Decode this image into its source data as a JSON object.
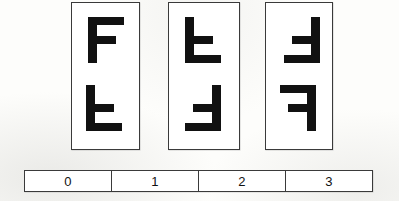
{
  "figure": {
    "background_color": "#fdfdfb",
    "ink_color": "#111111",
    "border_color": "#3a3a3a"
  },
  "panels": [
    {
      "name": "panel-0",
      "x": 71,
      "y": 2,
      "width": 69,
      "height": 148,
      "glyphs": [
        {
          "name": "glyph-f-upright",
          "label": "F",
          "orientation": "upright",
          "rotation_deg": 0,
          "mirrored": false,
          "x": 16,
          "y": 14,
          "width": 38,
          "height": 46
        },
        {
          "name": "glyph-f-flip-vertical",
          "label": "Ⅎ",
          "orientation": "flipped-vertical",
          "rotation_deg": 0,
          "mirrored": true,
          "x": 14,
          "y": 82,
          "width": 38,
          "height": 46
        }
      ]
    },
    {
      "name": "panel-1",
      "x": 168,
      "y": 2,
      "width": 72,
      "height": 148,
      "glyphs": [
        {
          "name": "glyph-f-flip-vertical",
          "label": "Ⅎ",
          "orientation": "flipped-vertical",
          "rotation_deg": 0,
          "mirrored": true,
          "x": 16,
          "y": 14,
          "width": 38,
          "height": 46
        },
        {
          "name": "glyph-f-rotated-180",
          "label": "Ⅎ",
          "orientation": "rotated-180",
          "rotation_deg": 180,
          "mirrored": false,
          "x": 14,
          "y": 82,
          "width": 38,
          "height": 46
        }
      ]
    },
    {
      "name": "panel-2",
      "x": 265,
      "y": 2,
      "width": 68,
      "height": 148,
      "glyphs": [
        {
          "name": "glyph-f-rotated-180",
          "label": "Ⅎ",
          "orientation": "rotated-180",
          "rotation_deg": 180,
          "mirrored": false,
          "x": 16,
          "y": 14,
          "width": 38,
          "height": 46
        },
        {
          "name": "glyph-f-mirror-horizontal",
          "label": "Ꟊ",
          "orientation": "mirrored-horizontal",
          "rotation_deg": 0,
          "mirrored": true,
          "x": 12,
          "y": 82,
          "width": 38,
          "height": 46
        }
      ]
    }
  ],
  "scale_bar": {
    "name": "scale-bar",
    "cells": [
      {
        "label": "0"
      },
      {
        "label": "1"
      },
      {
        "label": "2"
      },
      {
        "label": "3"
      }
    ]
  }
}
